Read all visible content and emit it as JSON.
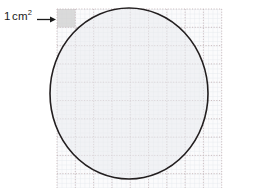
{
  "figure": {
    "background_color": "#ffffff",
    "width": 259,
    "height": 188
  },
  "annotation": {
    "unit_label_number": "1",
    "unit_label_unit": "cm",
    "unit_label_exponent": "2",
    "unit_label_full": "1 cm2",
    "arrow_icon_name": "arrow-right-icon",
    "arrow_color": "#1b1b1b",
    "points_to": "highlighted-unit-square"
  },
  "grid": {
    "label": "centimetre square grid",
    "left": 57,
    "top": 9,
    "right": 222,
    "bottom": 188,
    "major_spacing_px": 18.3,
    "minor_divisions_per_major": 4,
    "minor_spacing_px": 4.575,
    "major_line_color": "#c9b9bd",
    "minor_line_color": "#dfe3e8",
    "major_line_style": "dotted",
    "minor_line_style": "solid",
    "fill_color": "#fbfbfc",
    "major_columns": 9,
    "major_rows": 10
  },
  "unit_square": {
    "label": "1 cm2 highlighted unit square",
    "x": 57,
    "y": 9,
    "size_px": 18.3,
    "fill_color": "#cfcfcf",
    "opacity": 0.75
  },
  "circle": {
    "label": "circle outline with shaded interior",
    "center_x": 129,
    "center_y": 93.5,
    "radius_x": 79,
    "radius_y": 85.5,
    "stroke_color": "#231f20",
    "stroke_width": 1.6,
    "fill_color": "#e9ebee",
    "fill_opacity": 0.55,
    "left_extent": 50,
    "right_extent": 208,
    "top_extent": 8,
    "bottom_extent": 179
  }
}
